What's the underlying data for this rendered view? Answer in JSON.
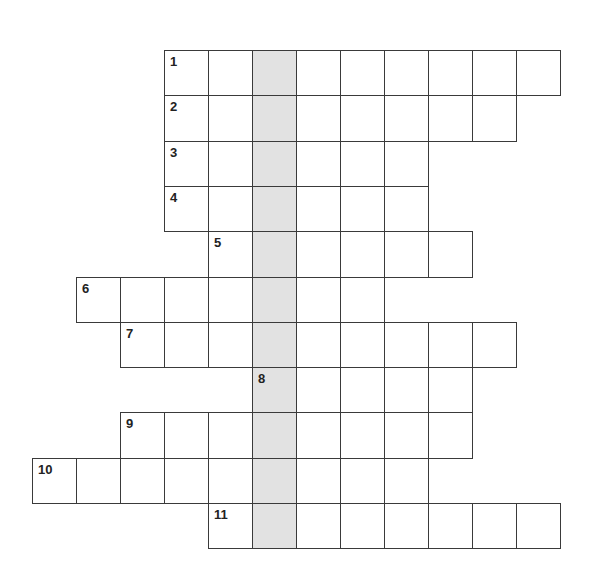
{
  "puzzle": {
    "grid": {
      "origin_x": 32,
      "origin_y": 50,
      "cell_w": 44,
      "cell_h": 45.3,
      "shaded_col": 5,
      "line_color": "#3a3a3a",
      "shade_color": "#e2e2e2"
    },
    "rows": [
      {
        "number": "1",
        "start_col": 3,
        "length": 9
      },
      {
        "number": "2",
        "start_col": 3,
        "length": 8
      },
      {
        "number": "3",
        "start_col": 3,
        "length": 6
      },
      {
        "number": "4",
        "start_col": 3,
        "length": 6
      },
      {
        "number": "5",
        "start_col": 4,
        "length": 6
      },
      {
        "number": "6",
        "start_col": 1,
        "length": 7
      },
      {
        "number": "7",
        "start_col": 2,
        "length": 9
      },
      {
        "number": "8",
        "start_col": 5,
        "length": 5
      },
      {
        "number": "9",
        "start_col": 2,
        "length": 8
      },
      {
        "number": "10",
        "start_col": 0,
        "length": 9
      },
      {
        "number": "11",
        "start_col": 4,
        "length": 8
      }
    ]
  }
}
